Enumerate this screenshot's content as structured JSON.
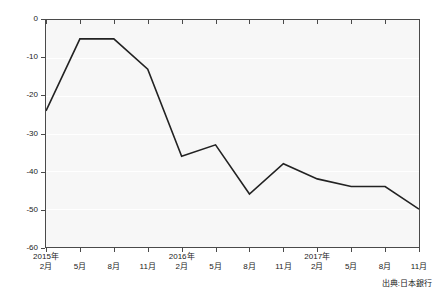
{
  "chart_data": {
    "type": "line",
    "title": "",
    "subtitle": "",
    "xlabel": "",
    "ylabel": "",
    "ylim": [
      -60,
      0
    ],
    "yticks": [
      0,
      -10,
      -20,
      -30,
      -40,
      -50,
      -60
    ],
    "ytick_labels": [
      "0",
      "-10",
      "-20",
      "-30",
      "-40",
      "-50",
      "-60"
    ],
    "grid": true,
    "grid_axis": "y",
    "legend": "none",
    "line_color": "#222222",
    "plot_background": "#f7f7f7",
    "gridline_color": "#ffffff",
    "categories": [
      "2015年2月",
      "5月",
      "8月",
      "11月",
      "2016年2月",
      "5月",
      "8月",
      "11月",
      "2017年2月",
      "5月",
      "8月",
      "11月"
    ],
    "xtick_years": [
      "2015年",
      "",
      "",
      "",
      "2016年",
      "",
      "",
      "",
      "2017年",
      "",
      "",
      ""
    ],
    "xtick_months": [
      "2月",
      "5月",
      "8月",
      "11月",
      "2月",
      "5月",
      "8月",
      "11月",
      "2月",
      "5月",
      "8月",
      "11月"
    ],
    "values": [
      -24,
      -5,
      -5,
      -13,
      -36,
      -33,
      -46,
      -38,
      -42,
      -44,
      -44,
      -50
    ],
    "series": [
      {
        "name": "",
        "values": [
          -24,
          -5,
          -5,
          -13,
          -36,
          -33,
          -46,
          -38,
          -42,
          -44,
          -44,
          -50
        ]
      }
    ],
    "annotations": []
  },
  "footer": {
    "source_label": "出典:日本銀行"
  }
}
